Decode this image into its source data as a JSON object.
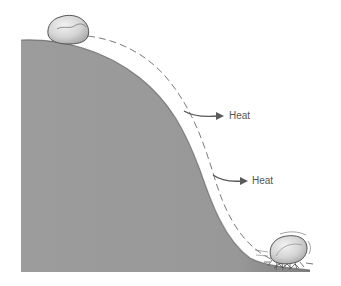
{
  "diagram": {
    "type": "illustration",
    "labels": {
      "heat_upper": "Heat",
      "heat_lower": "Heat"
    },
    "colors": {
      "hill": "#9a9a9a",
      "hill_edge": "#4a4a4a",
      "path": "#7a7a7a",
      "arrow": "#5a5a5a",
      "rock": "#d6d6d6",
      "rock_outline": "#555555",
      "text": "#555555"
    }
  }
}
